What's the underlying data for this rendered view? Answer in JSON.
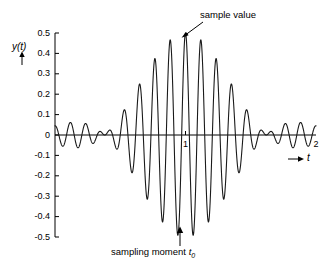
{
  "figure": {
    "background_color": "#ffffff",
    "line_color": "#1a1a1a",
    "axis_color": "#000000"
  },
  "axes": {
    "y_axis_label": "y(t)",
    "y_axis_arrow": "up-arrow-icon",
    "x_axis_label": "t",
    "x_axis_arrow": "right-arrow-icon"
  },
  "annotations": {
    "top": {
      "text": "sample value",
      "arrow": "arrow-down-left-icon"
    },
    "bottom": {
      "text": "sampling moment ",
      "symbol": "t",
      "subscript": "0",
      "arrow": "arrow-up-icon"
    }
  },
  "chart_data": {
    "type": "line",
    "title": "",
    "subtitle": "",
    "xlabel": "t",
    "ylabel": "y(t)",
    "xlim": [
      0,
      2
    ],
    "ylim": [
      -0.5,
      0.5
    ],
    "grid": false,
    "legend": "none",
    "x_ticks": [
      1,
      2
    ],
    "x_tick_labels": [
      "1",
      "2"
    ],
    "y_ticks": [
      -0.5,
      -0.4,
      -0.3,
      -0.2,
      -0.1,
      0,
      0.1,
      0.2,
      0.3,
      0.4,
      0.5
    ],
    "y_tick_labels": [
      "-0.5",
      "-0.4",
      "-0.3",
      "-0.2",
      "-0.1",
      "0",
      "0.1",
      "0.2",
      "0.3",
      "0.4",
      "0.5"
    ],
    "series": [
      {
        "name": "y(t)",
        "peak_value": 0.5,
        "peak_x": 1.0,
        "envelope_peaks_left": [
          0.005,
          0.13,
          0.25,
          0.375,
          0.5
        ],
        "envelope_troughs_left": [
          -0.075,
          -0.19,
          -0.315,
          -0.435
        ],
        "envelope_peaks_right": [
          0.375,
          0.25,
          0.13,
          0.005
        ],
        "envelope_troughs_right": [
          -0.435,
          -0.315,
          -0.19,
          -0.075
        ],
        "formula": "y(t) = 0.5 * sinc-like envelope * cos(2*pi*f*(t-1))",
        "points": [
          [
            0.0,
            0.0
          ],
          [
            0.01,
            0.013
          ],
          [
            0.02,
            0.024
          ],
          [
            0.03,
            0.029
          ],
          [
            0.04,
            0.026
          ],
          [
            0.05,
            0.016
          ],
          [
            0.06,
            0.001
          ],
          [
            0.07,
            -0.016
          ],
          [
            0.08,
            -0.034
          ],
          [
            0.09,
            -0.05
          ],
          [
            0.1,
            -0.063
          ],
          [
            0.11,
            -0.072
          ],
          [
            0.12,
            -0.075
          ],
          [
            0.13,
            -0.072
          ],
          [
            0.14,
            -0.063
          ],
          [
            0.15,
            -0.048
          ],
          [
            0.16,
            -0.027
          ],
          [
            0.17,
            -0.002
          ],
          [
            0.18,
            0.025
          ],
          [
            0.19,
            0.053
          ],
          [
            0.2,
            0.079
          ],
          [
            0.21,
            0.102
          ],
          [
            0.22,
            0.119
          ],
          [
            0.23,
            0.129
          ],
          [
            0.24,
            0.131
          ],
          [
            0.25,
            0.125
          ],
          [
            0.26,
            0.111
          ],
          [
            0.27,
            0.09
          ],
          [
            0.28,
            0.062
          ],
          [
            0.29,
            0.029
          ],
          [
            0.3,
            -0.007
          ],
          [
            0.31,
            -0.045
          ],
          [
            0.32,
            -0.082
          ],
          [
            0.33,
            -0.117
          ],
          [
            0.34,
            -0.147
          ],
          [
            0.35,
            -0.171
          ],
          [
            0.36,
            -0.186
          ],
          [
            0.37,
            -0.192
          ],
          [
            0.38,
            -0.189
          ],
          [
            0.39,
            -0.176
          ],
          [
            0.4,
            -0.154
          ],
          [
            0.41,
            -0.124
          ],
          [
            0.42,
            -0.087
          ],
          [
            0.43,
            -0.045
          ],
          [
            0.44,
            0.0
          ],
          [
            0.45,
            0.046
          ],
          [
            0.46,
            0.091
          ],
          [
            0.47,
            0.133
          ],
          [
            0.48,
            0.171
          ],
          [
            0.49,
            0.202
          ],
          [
            0.5,
            0.226
          ],
          [
            0.51,
            0.242
          ],
          [
            0.52,
            0.248
          ],
          [
            0.53,
            0.245
          ],
          [
            0.54,
            0.233
          ],
          [
            0.55,
            0.211
          ],
          [
            0.56,
            0.181
          ],
          [
            0.57,
            0.144
          ],
          [
            0.58,
            0.1
          ],
          [
            0.59,
            0.052
          ],
          [
            0.6,
            0.001
          ],
          [
            0.61,
            -0.051
          ],
          [
            0.62,
            -0.102
          ],
          [
            0.63,
            -0.15
          ],
          [
            0.64,
            -0.193
          ],
          [
            0.65,
            -0.23
          ],
          [
            0.66,
            -0.259
          ],
          [
            0.67,
            -0.28
          ],
          [
            0.68,
            -0.291
          ],
          [
            0.69,
            -0.292
          ],
          [
            0.7,
            -0.283
          ],
          [
            0.71,
            -0.265
          ],
          [
            0.72,
            -0.237
          ],
          [
            0.73,
            -0.2
          ],
          [
            0.74,
            -0.156
          ],
          [
            0.75,
            -0.106
          ],
          [
            0.76,
            -0.052
          ],
          [
            0.77,
            0.005
          ],
          [
            0.78,
            0.062
          ],
          [
            0.79,
            0.118
          ],
          [
            0.8,
            0.171
          ],
          [
            0.81,
            0.219
          ],
          [
            0.82,
            0.261
          ],
          [
            0.83,
            0.295
          ],
          [
            0.84,
            0.32
          ],
          [
            0.85,
            0.336
          ],
          [
            0.86,
            0.342
          ],
          [
            0.87,
            0.337
          ],
          [
            0.88,
            0.322
          ],
          [
            0.89,
            0.296
          ],
          [
            0.9,
            0.261
          ],
          [
            0.91,
            0.217
          ],
          [
            0.92,
            0.165
          ],
          [
            0.93,
            0.107
          ],
          [
            0.94,
            0.045
          ],
          [
            0.95,
            -0.02
          ],
          [
            0.96,
            -0.085
          ],
          [
            0.97,
            -0.148
          ],
          [
            0.98,
            -0.207
          ],
          [
            0.99,
            -0.26
          ],
          [
            1.0,
            0.5
          ]
        ]
      }
    ]
  }
}
